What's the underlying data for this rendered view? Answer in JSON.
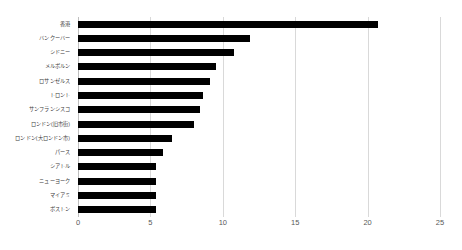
{
  "chart_data": {
    "type": "bar",
    "orientation": "horizontal",
    "title": "",
    "subtitle": "",
    "xlabel": "",
    "ylabel": "",
    "xlim": [
      0,
      25
    ],
    "xticks": [
      0,
      5,
      10,
      15,
      20,
      25
    ],
    "xtick_labels": [
      "0",
      "5",
      "10",
      "15",
      "20",
      "25"
    ],
    "grid": true,
    "grid_axis": "x",
    "legend": false,
    "legend_position": "none",
    "bar_color": "#000000",
    "gridline_color": "#d9d9d9",
    "categories": [
      "香港",
      "バンクーバー",
      "シドニー",
      "メルボルン",
      "ロサンゼルス",
      "トロント",
      "サンフランシスコ",
      "ロンドン(旧市街)",
      "ロンドン(大ロンドン市)",
      "パース",
      "シアトル",
      "ニューヨーク",
      "マイアミ",
      "ボストン"
    ],
    "values": [
      20.7,
      11.9,
      10.8,
      9.5,
      9.1,
      8.6,
      8.4,
      8.0,
      6.5,
      5.9,
      5.4,
      5.4,
      5.4,
      5.4
    ]
  }
}
